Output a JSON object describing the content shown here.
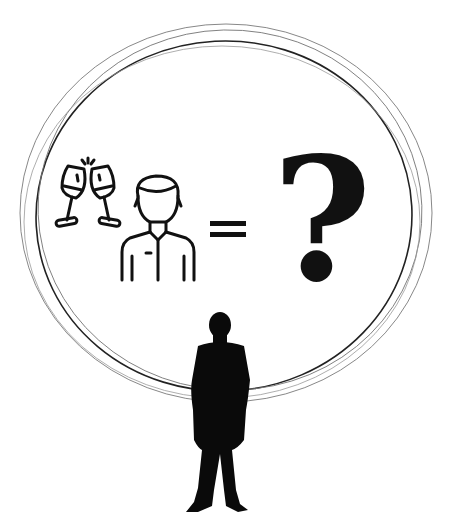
{
  "scene": {
    "description": "Illustration: toasting champagne glasses plus a person icon equals a question mark, inside hand-drawn circles, with a silhouetted standing figure below",
    "background": "#ffffff",
    "ink": "#111111",
    "ring_color": "#555555"
  },
  "equation": {
    "left_icon_1": "champagne-glasses-toast",
    "left_icon_2": "person-in-shirt",
    "operator": "=",
    "result": "?"
  },
  "figure": {
    "type": "standing-person-silhouette"
  }
}
